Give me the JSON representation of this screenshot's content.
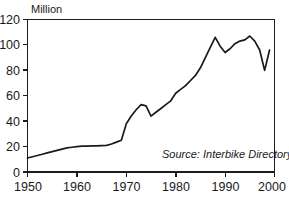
{
  "chart_data": {
    "type": "line",
    "title": "",
    "subtitle": "",
    "xlabel": "",
    "ylabel": "Million",
    "xlim": [
      1950,
      2000
    ],
    "ylim": [
      0,
      120
    ],
    "grid": false,
    "legend": "none",
    "xticks": [
      "1950",
      "1960",
      "1970",
      "1980",
      "1990",
      "2000"
    ],
    "xtick_values": [
      1950,
      1960,
      1970,
      1980,
      1990,
      2000
    ],
    "yticks": [
      "0",
      "20",
      "40",
      "60",
      "80",
      "100",
      "120"
    ],
    "ytick_values": [
      0,
      20,
      40,
      60,
      80,
      100,
      120
    ],
    "annotations": [
      {
        "name": "source-note",
        "text": "Source:  Interbike Directory, UN",
        "x": 1978,
        "y": 9
      }
    ],
    "series": [
      {
        "name": "Bicycle production",
        "x": [
          1950,
          1951,
          1952,
          1953,
          1954,
          1955,
          1956,
          1957,
          1958,
          1959,
          1960,
          1961,
          1962,
          1963,
          1964,
          1965,
          1966,
          1967,
          1968,
          1969,
          1970,
          1971,
          1972,
          1973,
          1974,
          1975,
          1976,
          1977,
          1978,
          1979,
          1980,
          1981,
          1982,
          1983,
          1984,
          1985,
          1986,
          1987,
          1988,
          1989,
          1990,
          1991,
          1992,
          1993,
          1994,
          1995,
          1996,
          1997,
          1998,
          1999
        ],
        "values": [
          11,
          12,
          13,
          14,
          15,
          16,
          17,
          18,
          19,
          19.5,
          20,
          20.3,
          20.4,
          20.5,
          20.6,
          20.8,
          21,
          22,
          23.5,
          25,
          38,
          44,
          49,
          53,
          52,
          44,
          47,
          50,
          53,
          56,
          62,
          65,
          68,
          72,
          76,
          82,
          90,
          98,
          106,
          99,
          94,
          97,
          101,
          103,
          104,
          107,
          103,
          96,
          80,
          96
        ]
      }
    ]
  },
  "axis": {
    "y_label": "Million"
  },
  "caption": {
    "partial_text": ""
  }
}
